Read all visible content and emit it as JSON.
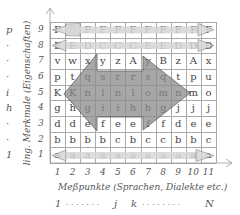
{
  "diagram": {
    "y_axis_label": "ling. Merkmale (Eigenschaften)",
    "x_axis_label": "Meßpunkte (Sprachen, Dialekte etc.)",
    "y_ticks": [
      "1",
      "2",
      "3",
      "4",
      "5",
      "6",
      "7",
      "8",
      "9"
    ],
    "x_ticks": [
      "1",
      "2",
      "3",
      "4",
      "5",
      "6",
      "7",
      "8",
      "9",
      "10",
      "11"
    ],
    "left_letters": [
      "p",
      "·",
      "·",
      "·",
      "i",
      "h",
      "·",
      "·",
      "1"
    ],
    "bottom_range": {
      "start": "1",
      "dots1": ". . . . . . .",
      "j": "j",
      "k": "k",
      "dots2": ". . . . . . . .",
      "end": "N"
    },
    "rows": [
      {
        "y": "9",
        "cells": [
          "F",
          "F",
          "F",
          "F",
          "F",
          "F",
          "F",
          "F",
          "F",
          "F",
          "F"
        ]
      },
      {
        "y": "8",
        "cells": [
          "E",
          "E",
          "D",
          "C",
          "C",
          "C",
          "E",
          "E",
          "D",
          "D",
          "D"
        ]
      },
      {
        "y": "7",
        "cells": [
          "v",
          "w",
          "x",
          "y",
          "z",
          "A",
          "y",
          "B",
          "z",
          "A",
          "x"
        ]
      },
      {
        "y": "6",
        "cells": [
          "p",
          "t",
          "q",
          "s",
          "r",
          "r",
          "s",
          "q",
          "t",
          "p",
          "u"
        ]
      },
      {
        "y": "5",
        "cells": [
          "K",
          "K",
          "n",
          "l",
          "n",
          "l",
          "o",
          "m",
          "n",
          "m",
          "o"
        ]
      },
      {
        "y": "4",
        "cells": [
          "g",
          "h",
          "g",
          "i",
          "i",
          "h",
          "h",
          "g",
          "j",
          "j",
          "j"
        ]
      },
      {
        "y": "3",
        "cells": [
          "d",
          "d",
          "e",
          "f",
          "e",
          "e",
          "f",
          "f",
          "d",
          "e",
          "e"
        ]
      },
      {
        "y": "2",
        "cells": [
          "b",
          "b",
          "b",
          "b",
          "c",
          "b",
          "c",
          "c",
          "b",
          "b",
          "c"
        ]
      },
      {
        "y": "1",
        "cells": [
          "a",
          "a",
          "a",
          "a",
          "a",
          "a",
          "a",
          "a",
          "a",
          "a",
          "a"
        ]
      }
    ],
    "colors": {
      "arrow_light": "#d6d6d6",
      "arrow_dark": "#8a8a8a",
      "grid": "#aaaaaa"
    }
  }
}
